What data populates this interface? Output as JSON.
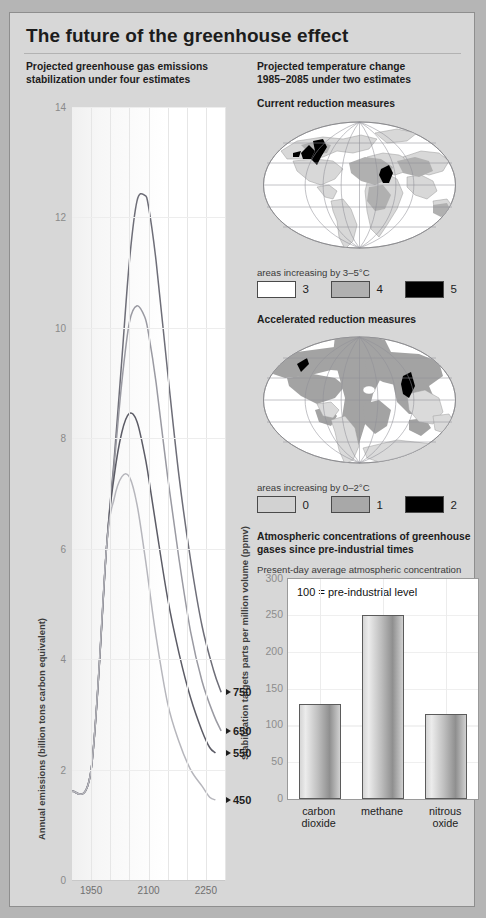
{
  "title": "The future of the greenhouse effect",
  "left_panel": {
    "heading_line1": "Projected greenhouse gas emissions",
    "heading_line2": "stabilization under four estimates",
    "ylabel_left": "Annual emissions (billion tons carbon equivalent)",
    "ylabel_right": "Stabilization targets parts per million volume (ppmv)"
  },
  "right_panel": {
    "heading_line1": "Projected temperature change",
    "heading_line2": "1985–2085 under two estimates",
    "map1_title": "Current reduction measures",
    "map1_legend_title": "areas increasing by 3–5°C",
    "map1_legend": [
      {
        "label": "3",
        "color": "#ffffff"
      },
      {
        "label": "4",
        "color": "#b0b0b0"
      },
      {
        "label": "5",
        "color": "#000000"
      }
    ],
    "map2_title": "Accelerated reduction measures",
    "map2_legend_title": "areas increasing by 0–2°C",
    "map2_legend": [
      {
        "label": "0",
        "color": "#d2d2d2"
      },
      {
        "label": "1",
        "color": "#a8a8a8"
      },
      {
        "label": "2",
        "color": "#000000"
      }
    ],
    "bar_heading_line1": "Atmospheric concentrations of greenhouse",
    "bar_heading_line2": "gases since pre-industrial times",
    "bar_subheading": "Present-day average atmospheric concentration",
    "bar_note": "100 = pre-industrial level"
  },
  "chart_data": [
    {
      "type": "line",
      "title": "Projected greenhouse gas emissions stabilization under four estimates",
      "xlabel": "",
      "ylabel": "Annual emissions (billion tons carbon equivalent)",
      "ylabel_right": "Stabilization targets parts per million volume (ppmv)",
      "xlim": [
        1900,
        2300
      ],
      "ylim": [
        0,
        14
      ],
      "yticks": [
        0,
        2,
        4,
        6,
        8,
        10,
        12,
        14
      ],
      "xticks": [
        1950,
        2100,
        2250
      ],
      "grid": true,
      "legend": "end-of-line labels",
      "series": [
        {
          "name": "750",
          "color": "#6e6e78",
          "end_label": "750",
          "x": [
            1900,
            1950,
            1990,
            2010,
            2030,
            2050,
            2070,
            2090,
            2100,
            2120,
            2150,
            2180,
            2210,
            2240,
            2270,
            2290
          ],
          "y": [
            1.6,
            2.0,
            6.0,
            7.6,
            9.4,
            11.2,
            12.3,
            12.4,
            12.2,
            11.2,
            9.2,
            7.3,
            5.8,
            4.6,
            3.8,
            3.4
          ]
        },
        {
          "name": "650",
          "color": "#9a9aa2",
          "end_label": "650",
          "x": [
            1900,
            1950,
            1990,
            2010,
            2030,
            2050,
            2070,
            2090,
            2100,
            2120,
            2150,
            2180,
            2210,
            2240,
            2270,
            2290
          ],
          "y": [
            1.6,
            2.0,
            6.0,
            7.5,
            9.0,
            10.1,
            10.4,
            10.2,
            9.9,
            9.0,
            7.3,
            5.8,
            4.5,
            3.6,
            3.0,
            2.7
          ]
        },
        {
          "name": "550",
          "color": "#5c5c66",
          "end_label": "550",
          "x": [
            1900,
            1950,
            1990,
            2010,
            2030,
            2050,
            2070,
            2090,
            2100,
            2120,
            2150,
            2180,
            2210,
            2240,
            2260,
            2275
          ],
          "y": [
            1.6,
            2.0,
            6.0,
            7.3,
            8.1,
            8.45,
            8.3,
            7.7,
            7.3,
            6.4,
            5.1,
            4.1,
            3.3,
            2.7,
            2.4,
            2.3
          ]
        },
        {
          "name": "450",
          "color": "#b6b6bc",
          "end_label": "450",
          "x": [
            1900,
            1950,
            1990,
            2010,
            2030,
            2050,
            2070,
            2090,
            2100,
            2120,
            2150,
            2180,
            2210,
            2240,
            2260,
            2275
          ],
          "y": [
            1.6,
            2.0,
            6.0,
            6.9,
            7.3,
            7.3,
            6.8,
            5.9,
            5.4,
            4.4,
            3.2,
            2.5,
            2.0,
            1.7,
            1.5,
            1.45
          ]
        }
      ]
    },
    {
      "type": "bar",
      "title": "Atmospheric concentrations of greenhouse gases since pre-industrial times",
      "subtitle": "Present-day average atmospheric concentration",
      "annotation": "100 = pre-industrial level",
      "categories": [
        "carbon dioxide",
        "methane",
        "nitrous oxide"
      ],
      "values": [
        129,
        251,
        116
      ],
      "xlabel": "",
      "ylabel": "",
      "ylim": [
        0,
        300
      ],
      "yticks": [
        0,
        50,
        100,
        150,
        200,
        250,
        300
      ],
      "reference_line": 100,
      "grid": true
    }
  ]
}
